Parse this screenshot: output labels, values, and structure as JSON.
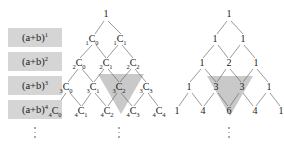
{
  "figure": {
    "title_hidden": "",
    "background_color": "#ffffff",
    "shade_color": "#c9c9c9",
    "label_bg_color": "#d5d5d5",
    "text_color": "#1a1a1a"
  },
  "power_labels": [
    {
      "base": "(a+b)",
      "exponent": "1"
    },
    {
      "base": "(a+b)",
      "exponent": "2"
    },
    {
      "base": "(a+b)",
      "exponent": "3"
    },
    {
      "base": "(a+b)",
      "exponent": "4"
    }
  ],
  "ellipsis_left_column": "⋮",
  "combination_triangle": {
    "caption": "",
    "apex_label": "1",
    "rows": [
      {
        "n": 1,
        "cells": [
          {
            "pre": "1",
            "sym": "C",
            "sub": "0"
          },
          {
            "pre": "1",
            "sym": "C",
            "sub": "1"
          }
        ]
      },
      {
        "n": 2,
        "cells": [
          {
            "pre": "2",
            "sym": "C",
            "sub": "0"
          },
          {
            "pre": "2",
            "sym": "C",
            "sub": "1"
          },
          {
            "pre": "2",
            "sym": "C",
            "sub": "2"
          }
        ]
      },
      {
        "n": 3,
        "cells": [
          {
            "pre": "3",
            "sym": "C",
            "sub": "0"
          },
          {
            "pre": "3",
            "sym": "C",
            "sub": "1"
          },
          {
            "pre": "3",
            "sym": "C",
            "sub": "2"
          },
          {
            "pre": "3",
            "sym": "C",
            "sub": "3"
          }
        ]
      },
      {
        "n": 4,
        "cells": [
          {
            "pre": "4",
            "sym": "C",
            "sub": "0"
          },
          {
            "pre": "4",
            "sym": "C",
            "sub": "1"
          },
          {
            "pre": "4",
            "sym": "C",
            "sub": "2"
          },
          {
            "pre": "4",
            "sym": "C",
            "sub": "3"
          },
          {
            "pre": "4",
            "sym": "C",
            "sub": "4"
          }
        ]
      }
    ],
    "ellipsis": "⋮"
  },
  "pascal_triangle": {
    "caption": "",
    "apex_label": "1",
    "rows": [
      {
        "n": 1,
        "values": [
          "1",
          "1"
        ]
      },
      {
        "n": 2,
        "values": [
          "1",
          "2",
          "1"
        ]
      },
      {
        "n": 3,
        "values": [
          "1",
          "3",
          "3",
          "1"
        ]
      },
      {
        "n": 4,
        "values": [
          "1",
          "4",
          "6",
          "4",
          "1"
        ]
      }
    ],
    "ellipsis": "⋮"
  }
}
